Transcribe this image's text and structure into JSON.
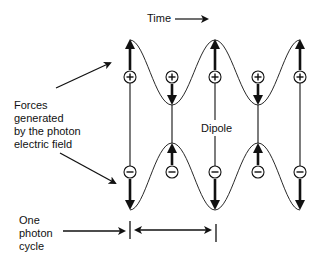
{
  "diagram": {
    "time_label": "Time",
    "forces_label": [
      "Forces",
      "generated",
      "by the photon",
      "electric field"
    ],
    "dipole_label": "Dipole",
    "cycle_label": [
      "One",
      "photon",
      "cycle"
    ],
    "plus_symbol": "+",
    "minus_symbol": "−",
    "columns": [
      {
        "x": 130,
        "top_force": "up",
        "bottom_force": "down"
      },
      {
        "x": 172,
        "top_force": "down",
        "bottom_force": "up"
      },
      {
        "x": 215,
        "top_force": "up",
        "bottom_force": "down"
      },
      {
        "x": 258,
        "top_force": "down",
        "bottom_force": "up"
      },
      {
        "x": 300,
        "top_force": "up",
        "bottom_force": "down"
      }
    ],
    "colors": {
      "line": "#111111",
      "background": "#ffffff"
    }
  }
}
